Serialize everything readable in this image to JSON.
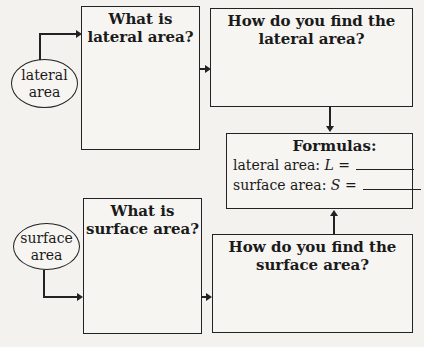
{
  "ovals": {
    "lateral": {
      "line1": "lateral",
      "line2": "area"
    },
    "surface": {
      "line1": "surface",
      "line2": "area"
    }
  },
  "boxes": {
    "what_lateral": {
      "line1": "What is",
      "line2": "lateral area?"
    },
    "how_lateral": {
      "line1": "How do you find the",
      "line2": "lateral area?"
    },
    "what_surface": {
      "line1": "What is",
      "line2": "surface area?"
    },
    "how_surface": {
      "line1": "How do you find the",
      "line2": "surface area?"
    }
  },
  "formulas": {
    "title": "Formulas:",
    "rows": [
      {
        "label": "lateral area: ",
        "var": "L",
        "eq": " ="
      },
      {
        "label": "surface area: ",
        "var": "S",
        "eq": " ="
      }
    ]
  }
}
